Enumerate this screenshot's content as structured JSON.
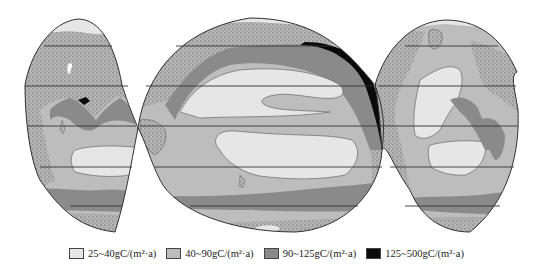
{
  "figure": {
    "type": "world ocean primary productivity distribution map (interrupted projection)",
    "colors": {
      "land_stipple": "#a8a8a8",
      "class1": "#e6e6e6",
      "class2": "#bdbdbd",
      "class3": "#8a8a8a",
      "class4": "#0a0a0a",
      "outline": "#333333",
      "latitude_line": "#333333"
    }
  },
  "legend": {
    "items": [
      {
        "label": "25~40gC/(m²·a)",
        "color": "#e6e6e6"
      },
      {
        "label": "40~90gC/(m²·a)",
        "color": "#bdbdbd"
      },
      {
        "label": "90~125gC/(m²·a)",
        "color": "#8a8a8a"
      },
      {
        "label": "125~500gC/(m²·a)",
        "color": "#0a0a0a"
      }
    ]
  }
}
